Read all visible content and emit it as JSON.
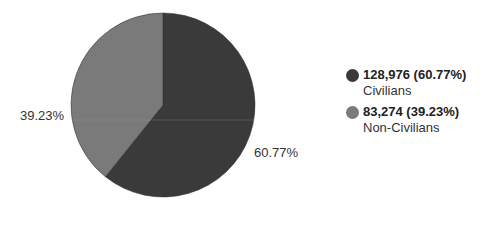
{
  "chart_data": {
    "type": "pie",
    "title": "",
    "categories": [
      "Civilians",
      "Non-Civilians"
    ],
    "values": [
      128976,
      83274
    ],
    "percentages": [
      60.77,
      39.23
    ],
    "colors": [
      "#3a3a3a",
      "#7a7a7a"
    ],
    "slice_labels": [
      "60.77%",
      "39.23%"
    ],
    "legend_position": "right"
  },
  "legend": {
    "items": [
      {
        "value": "128,976 (60.77%)",
        "name": "Civilians",
        "color": "#3a3a3a"
      },
      {
        "value": "83,274 (39.23%)",
        "name": "Non-Civilians",
        "color": "#7a7a7a"
      }
    ]
  },
  "labels": {
    "civilians_pct": "60.77%",
    "non_civilians_pct": "39.23%"
  }
}
